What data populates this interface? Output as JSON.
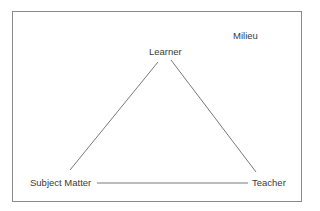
{
  "diagram": {
    "type": "triangle",
    "context_label": "Milieu",
    "nodes": {
      "top": "Learner",
      "bottom_left": "Subject Matter",
      "bottom_right": "Teacher"
    },
    "edges": [
      {
        "from": "Learner",
        "to": "Subject Matter"
      },
      {
        "from": "Learner",
        "to": "Teacher"
      },
      {
        "from": "Subject Matter",
        "to": "Teacher"
      }
    ],
    "colors": {
      "line": "#555555",
      "text": "#3a3a3a",
      "border": "#8a8a8a"
    }
  }
}
